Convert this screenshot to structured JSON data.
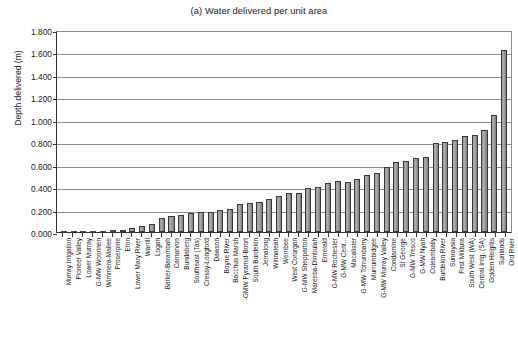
{
  "chart_data": {
    "type": "bar",
    "title": "(a) Water delivered per unit area",
    "xlabel": "",
    "ylabel": "Depth delivered (m)",
    "ylim": [
      0,
      1.8
    ],
    "ytick_labels": [
      "1.800",
      "1.600",
      "1.400",
      "1.200",
      "1.000",
      "0.800",
      "0.600",
      "0.400",
      "0.200",
      "0.000"
    ],
    "ytick_values": [
      1.8,
      1.6,
      1.4,
      1.2,
      1.0,
      0.8,
      0.6,
      0.4,
      0.2,
      0.0
    ],
    "grid": true,
    "legend": "none",
    "bar_color": "#9a9a9a",
    "bar_edge_color": "#3a3a3a",
    "categories": [
      "Murray Irrigation",
      "Pioneer Valley",
      "Lower Murray",
      "G-MW Woorinen",
      "Wimmera-Mallee",
      "Proserpine",
      "Eton",
      "Lower Mary River",
      "Warrill",
      "Logan",
      "Barker-Barambah",
      "Carnarvon",
      "Bundaberg",
      "Southeast (Tas)",
      "Cressy-Longford",
      "Dawson",
      "Boyne River",
      "Bacchus Marsh",
      "-GMW Pyramid-Boort",
      "South Burdekin",
      "Jemalong",
      "Winnaleah",
      "Wembee",
      "West Corurgan",
      "G-MW Shepparton",
      "Mareeba-Dimbulah",
      "Emerald",
      "G-MW Rochester",
      "G-MW Cent...",
      "Macalister",
      "G-MW Torrumbarry",
      "Murrumbidgee",
      "G-MW Murray Valley",
      "Condamine",
      "St George",
      "G-MW Tresco",
      "G-MW Nyah",
      "Coleambally",
      "Burdekin River",
      "Sunraysia",
      "First Mildura",
      "South West (WA)",
      "Central Irrig. (SA)",
      "Golden Heights",
      "Sunlands",
      "Ord River"
    ],
    "values": [
      0.004,
      0.006,
      0.006,
      0.007,
      0.008,
      0.014,
      0.018,
      0.035,
      0.052,
      0.075,
      0.128,
      0.145,
      0.15,
      0.172,
      0.18,
      0.182,
      0.196,
      0.205,
      0.252,
      0.258,
      0.268,
      0.298,
      0.318,
      0.345,
      0.352,
      0.392,
      0.402,
      0.435,
      0.456,
      0.45,
      0.472,
      0.508,
      0.53,
      0.578,
      0.62,
      0.632,
      0.658,
      0.668,
      0.79,
      0.802,
      0.82,
      0.856,
      0.862,
      0.905,
      1.042,
      1.618
    ]
  }
}
